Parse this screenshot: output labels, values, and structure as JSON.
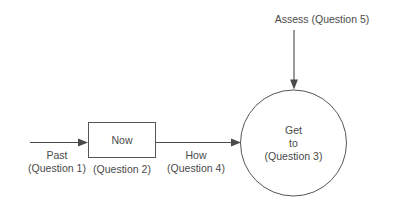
{
  "diagram": {
    "canvas": {
      "width": 395,
      "height": 210,
      "background": "#ffffff"
    },
    "colors": {
      "stroke": "#555555",
      "text": "#4a4a4a",
      "arrow": "#4a4a4a"
    },
    "nodes": {
      "now_box": {
        "label": "Now",
        "sublabel": "(Question 2)",
        "shape": "rectangle"
      },
      "goal_circle": {
        "line1": "Get",
        "line2": "to",
        "line3": "(Question 3)",
        "shape": "circle"
      }
    },
    "edges": {
      "past_arrow": {
        "label": "Past",
        "sublabel": "(Question 1)",
        "direction": "right"
      },
      "how_arrow": {
        "label": "How",
        "sublabel": "(Question 4)",
        "direction": "right"
      },
      "assess_arrow": {
        "label": "Assess (Question 5)",
        "direction": "down"
      }
    }
  }
}
